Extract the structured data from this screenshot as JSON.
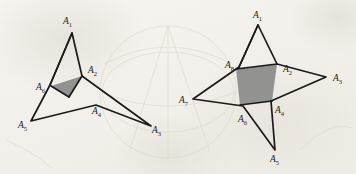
{
  "figure": {
    "caption": "",
    "background_color": "#f4f2ee",
    "ink_color": "#1a1a1a",
    "shade_color": "#8a8a8a",
    "bleed_color": "#e3ded4",
    "panels": [
      {
        "id": "left-panel",
        "name": "six-pointed-star-polygon",
        "vertex_count": 6,
        "shaded_region": "triangle",
        "labels": [
          {
            "base": "A",
            "sub": "1",
            "text": "A1",
            "x": 63,
            "y": 24
          },
          {
            "base": "A",
            "sub": "2",
            "text": "A2",
            "x": 88,
            "y": 73
          },
          {
            "base": "A",
            "sub": "3",
            "text": "A3",
            "x": 152,
            "y": 133
          },
          {
            "base": "A",
            "sub": "4",
            "text": "A4",
            "x": 92,
            "y": 114
          },
          {
            "base": "A",
            "sub": "5",
            "text": "A5",
            "x": 18,
            "y": 128
          },
          {
            "base": "A",
            "sub": "6",
            "text": "A6",
            "x": 36,
            "y": 90
          }
        ],
        "vertices": [
          {
            "label": "A1",
            "x": 72,
            "y": 33
          },
          {
            "label": "A2",
            "x": 82,
            "y": 76
          },
          {
            "label": "A3",
            "x": 151,
            "y": 126
          },
          {
            "label": "A4",
            "x": 96,
            "y": 105
          },
          {
            "label": "A5",
            "x": 31,
            "y": 121
          },
          {
            "label": "A6",
            "x": 50,
            "y": 85
          }
        ],
        "shade_polygon": [
          {
            "x": 82,
            "y": 76
          },
          {
            "x": 69,
            "y": 97
          },
          {
            "x": 51,
            "y": 86
          }
        ]
      },
      {
        "id": "right-panel",
        "name": "eight-pointed-star-polygon",
        "vertex_count": 8,
        "shaded_region": "quadrilateral",
        "labels": [
          {
            "base": "A",
            "sub": "1",
            "text": "A1",
            "x": 253,
            "y": 18
          },
          {
            "base": "A",
            "sub": "2",
            "text": "A2",
            "x": 283,
            "y": 72
          },
          {
            "base": "A",
            "sub": "3",
            "text": "A3",
            "x": 333,
            "y": 81
          },
          {
            "base": "A",
            "sub": "4",
            "text": "A4",
            "x": 275,
            "y": 113
          },
          {
            "base": "A",
            "sub": "5",
            "text": "A5",
            "x": 270,
            "y": 162
          },
          {
            "base": "A",
            "sub": "6",
            "text": "A6",
            "x": 238,
            "y": 122
          },
          {
            "base": "A",
            "sub": "7",
            "text": "A7",
            "x": 179,
            "y": 103
          },
          {
            "base": "A",
            "sub": "8",
            "text": "A8",
            "x": 225,
            "y": 68
          }
        ],
        "vertices": [
          {
            "label": "A1",
            "x": 258,
            "y": 25
          },
          {
            "label": "A2",
            "x": 277,
            "y": 64
          },
          {
            "label": "A3",
            "x": 326,
            "y": 77
          },
          {
            "label": "A4",
            "x": 271,
            "y": 101
          },
          {
            "label": "A5",
            "x": 275,
            "y": 150
          },
          {
            "label": "A6",
            "x": 243,
            "y": 106
          },
          {
            "label": "A7",
            "x": 193,
            "y": 99
          },
          {
            "label": "A8",
            "x": 239,
            "y": 67
          }
        ],
        "shade_polygon": [
          {
            "x": 277,
            "y": 64
          },
          {
            "x": 272,
            "y": 101
          },
          {
            "x": 240,
            "y": 105
          },
          {
            "x": 236,
            "y": 69
          }
        ]
      }
    ],
    "bleed_through": {
      "description": "faint reverse-side circular figure",
      "circles": [
        {
          "cx": 168,
          "cy": 92,
          "rx": 68,
          "ry": 66
        }
      ]
    }
  }
}
